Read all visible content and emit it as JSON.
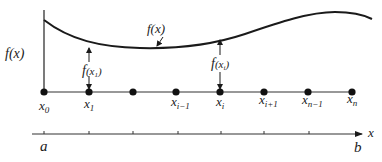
{
  "diagram": {
    "colors": {
      "ink": "#1a1a1a",
      "line": "#333333",
      "background": "#ffffff"
    },
    "curve": {
      "label": "f(x)",
      "y_axis_label": "f(x)"
    },
    "function_values": [
      {
        "label_main": "f",
        "label_arg": "(x",
        "label_sub": "1",
        "label_close": ")"
      },
      {
        "label_main": "f",
        "label_arg": "(x",
        "label_sub": "i",
        "label_close": ")"
      }
    ],
    "partition_points": [
      {
        "base": "x",
        "sub": "0"
      },
      {
        "base": "x",
        "sub": "1"
      },
      {
        "base": "",
        "sub": ""
      },
      {
        "base": "x",
        "sub": "i−1"
      },
      {
        "base": "x",
        "sub": "i"
      },
      {
        "base": "x",
        "sub": "i+1"
      },
      {
        "base": "x",
        "sub": "n−1"
      },
      {
        "base": "x",
        "sub": "n"
      }
    ],
    "axis": {
      "start_label": "a",
      "end_label": "b",
      "variable_label": "x"
    }
  }
}
